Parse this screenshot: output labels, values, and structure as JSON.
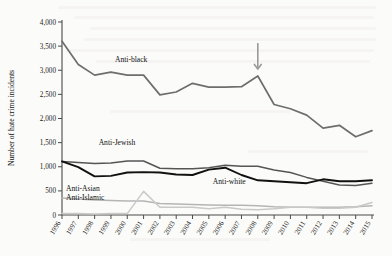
{
  "figure": {
    "background_color": "#fbfbf9",
    "axis_color": "#4a4a4a"
  },
  "annotations": [
    {
      "name": "arrow-2008",
      "type": "down-arrow",
      "points_at_year": "2008",
      "color": "#9a9a9a"
    }
  ],
  "chart_data": {
    "type": "line",
    "title": "",
    "subtitle": "",
    "xlabel": "",
    "ylabel": "Number of hate crime incidents",
    "xlim": [
      1996,
      2015
    ],
    "ylim": [
      0,
      4000
    ],
    "grid": false,
    "legend_position": "inline-labels",
    "y_ticks": [
      0,
      500,
      1000,
      1500,
      2000,
      2500,
      3000,
      3500,
      4000
    ],
    "y_tick_labels": [
      "0",
      "500",
      "1,000",
      "1,500",
      "2,000",
      "2,500",
      "3,000",
      "3,500",
      "4,000"
    ],
    "categories": [
      "1996",
      "1997",
      "1998",
      "1999",
      "2000",
      "2001",
      "2002",
      "2003",
      "2004",
      "2005",
      "2006",
      "2007",
      "2008",
      "2009",
      "2010",
      "2011",
      "2012",
      "2013",
      "2014",
      "2015"
    ],
    "series": [
      {
        "name": "Anti-black",
        "label": "Anti-black",
        "color": "#6e6e6e",
        "width": 1.7,
        "label_x_year": "1999",
        "label_y_value": 3180,
        "values": [
          3600,
          3120,
          2900,
          2960,
          2900,
          2900,
          2490,
          2550,
          2730,
          2650,
          2650,
          2660,
          2880,
          2290,
          2200,
          2070,
          1800,
          1860,
          1620,
          1750
        ]
      },
      {
        "name": "Anti-Jewish",
        "label": "Anti-Jewish",
        "color": "#555555",
        "width": 1.5,
        "label_x_year": "1998",
        "label_y_value": 1460,
        "values": [
          1110,
          1090,
          1070,
          1080,
          1120,
          1120,
          970,
          960,
          960,
          980,
          1030,
          1010,
          1010,
          930,
          880,
          780,
          700,
          620,
          610,
          660
        ]
      },
      {
        "name": "Anti-white",
        "label": "Anti-white",
        "color": "#111111",
        "width": 1.9,
        "label_x_year": "2005",
        "label_y_value": 640,
        "values": [
          1110,
          990,
          800,
          810,
          880,
          890,
          880,
          840,
          830,
          940,
          980,
          830,
          720,
          700,
          680,
          660,
          740,
          700,
          700,
          720
        ]
      },
      {
        "name": "Anti-Asian",
        "label": "Anti-Asian",
        "color": "#b5b5b5",
        "width": 1.5,
        "label_x_year": "1996",
        "label_y_value": 500,
        "values": [
          350,
          330,
          310,
          300,
          290,
          290,
          240,
          230,
          220,
          210,
          200,
          200,
          190,
          170,
          160,
          160,
          160,
          160,
          170,
          190
        ]
      },
      {
        "name": "Anti-Islamic",
        "label": "Anti-Islamic",
        "color": "#c9c9c9",
        "width": 1.5,
        "label_x_year": "1996",
        "label_y_value": 310,
        "values": [
          30,
          30,
          20,
          30,
          30,
          490,
          160,
          160,
          160,
          130,
          160,
          120,
          110,
          130,
          160,
          160,
          140,
          140,
          160,
          260
        ]
      }
    ]
  }
}
